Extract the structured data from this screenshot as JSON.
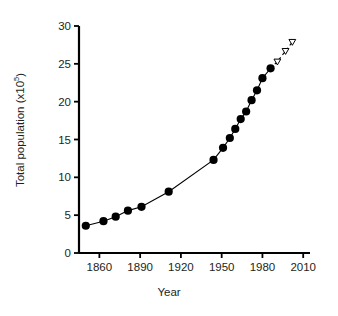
{
  "chart_data": {
    "type": "line",
    "title": "",
    "xlabel": "Year",
    "ylabel": "Total population (x10",
    "ylabel_exponent": "5",
    "ylabel_suffix": ")",
    "xlim": [
      1845,
      2015
    ],
    "ylim": [
      0,
      30
    ],
    "xticks": [
      1860,
      1890,
      1920,
      1950,
      1980,
      2010
    ],
    "xtick_labels": [
      "1860",
      "1890",
      "1920",
      "1950",
      "1980",
      "2010"
    ],
    "yticks": [
      0,
      5,
      10,
      15,
      20,
      25,
      30
    ],
    "ytick_labels": [
      "0",
      "5",
      "10",
      "15",
      "20",
      "25",
      "30"
    ],
    "grid": false,
    "legend": false,
    "series": [
      {
        "name": "Observed total population",
        "marker": "filled-circle",
        "line": "solid",
        "color": "#000000",
        "points": [
          {
            "x": 1850,
            "y": 3.6
          },
          {
            "x": 1863,
            "y": 4.2
          },
          {
            "x": 1872,
            "y": 4.8
          },
          {
            "x": 1881,
            "y": 5.6
          },
          {
            "x": 1891,
            "y": 6.1
          },
          {
            "x": 1911,
            "y": 8.1
          },
          {
            "x": 1944,
            "y": 12.3
          },
          {
            "x": 1951,
            "y": 13.9
          },
          {
            "x": 1956,
            "y": 15.2
          },
          {
            "x": 1960,
            "y": 16.4
          },
          {
            "x": 1964,
            "y": 17.7
          },
          {
            "x": 1968,
            "y": 18.7
          },
          {
            "x": 1972,
            "y": 20.2
          },
          {
            "x": 1976,
            "y": 21.5
          },
          {
            "x": 1980,
            "y": 23.1
          },
          {
            "x": 1986,
            "y": 24.4
          }
        ]
      },
      {
        "name": "Projected total population",
        "marker": "open-triangle",
        "line": "dashed",
        "color": "#000000",
        "points": [
          {
            "x": 1991,
            "y": 25.3
          },
          {
            "x": 1997,
            "y": 26.7
          },
          {
            "x": 2002,
            "y": 27.9
          }
        ]
      }
    ]
  }
}
